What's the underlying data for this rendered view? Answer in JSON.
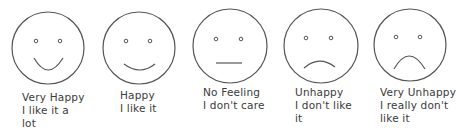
{
  "scale": {
    "items": [
      {
        "id": "very-happy",
        "expression": "big-smile",
        "lines": [
          "Very Happy",
          "I like it a",
          "lot"
        ]
      },
      {
        "id": "happy",
        "expression": "smile",
        "lines": [
          "Happy",
          "I like it"
        ]
      },
      {
        "id": "no-feeling",
        "expression": "neutral",
        "lines": [
          "No Feeling",
          "I don't care"
        ]
      },
      {
        "id": "unhappy",
        "expression": "frown",
        "lines": [
          "Unhappy",
          "I don't like",
          "it"
        ]
      },
      {
        "id": "very-unhappy",
        "expression": "big-frown",
        "lines": [
          "Very Unhappy",
          "I really don't",
          "like it"
        ]
      }
    ]
  },
  "colors": {
    "stroke": "#555555",
    "text": "#3a3a3a",
    "background": "#ffffff"
  }
}
